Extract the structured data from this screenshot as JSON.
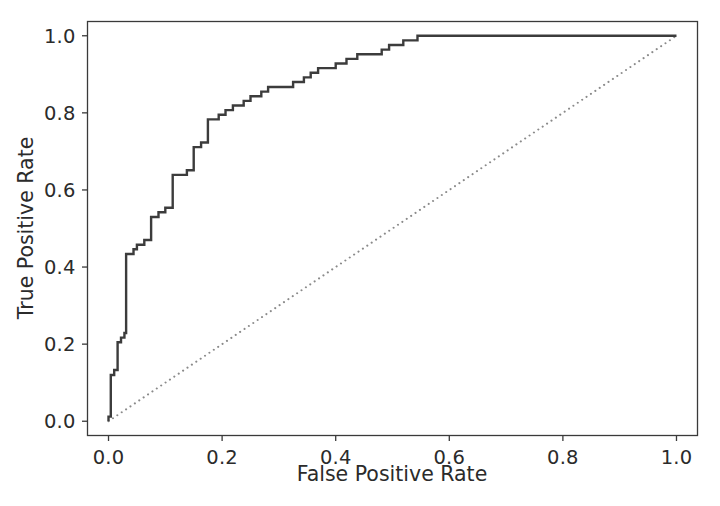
{
  "chart_data": {
    "type": "line",
    "title": "",
    "xlabel": "False Positive Rate",
    "ylabel": "True Positive Rate",
    "xlim": [
      -0.037,
      1.037
    ],
    "ylim": [
      -0.037,
      1.037
    ],
    "grid": false,
    "legend": null,
    "xticks": [
      "0.0",
      "0.2",
      "0.4",
      "0.6",
      "0.8",
      "1.0"
    ],
    "xtick_values": [
      0.0,
      0.2,
      0.4,
      0.6,
      0.8,
      1.0
    ],
    "yticks": [
      "0.0",
      "0.2",
      "0.4",
      "0.6",
      "0.8",
      "1.0"
    ],
    "ytick_values": [
      0.0,
      0.2,
      0.4,
      0.6,
      0.8,
      1.0
    ],
    "series": [
      {
        "name": "ROC curve",
        "style": "step-post",
        "color": "#3c3c3c",
        "linewidth": 2.4,
        "linestyle": "solid",
        "points": [
          [
            0.0,
            0.0
          ],
          [
            0.0,
            0.012
          ],
          [
            0.004,
            0.012
          ],
          [
            0.004,
            0.12
          ],
          [
            0.01,
            0.12
          ],
          [
            0.01,
            0.133
          ],
          [
            0.016,
            0.133
          ],
          [
            0.016,
            0.205
          ],
          [
            0.022,
            0.205
          ],
          [
            0.022,
            0.217
          ],
          [
            0.028,
            0.217
          ],
          [
            0.028,
            0.229
          ],
          [
            0.031,
            0.229
          ],
          [
            0.031,
            0.434
          ],
          [
            0.044,
            0.434
          ],
          [
            0.044,
            0.446
          ],
          [
            0.05,
            0.446
          ],
          [
            0.05,
            0.458
          ],
          [
            0.063,
            0.458
          ],
          [
            0.063,
            0.47
          ],
          [
            0.075,
            0.47
          ],
          [
            0.075,
            0.53
          ],
          [
            0.088,
            0.53
          ],
          [
            0.088,
            0.542
          ],
          [
            0.1,
            0.542
          ],
          [
            0.1,
            0.554
          ],
          [
            0.113,
            0.554
          ],
          [
            0.113,
            0.639
          ],
          [
            0.138,
            0.639
          ],
          [
            0.138,
            0.651
          ],
          [
            0.15,
            0.651
          ],
          [
            0.15,
            0.711
          ],
          [
            0.163,
            0.711
          ],
          [
            0.163,
            0.723
          ],
          [
            0.175,
            0.723
          ],
          [
            0.175,
            0.783
          ],
          [
            0.194,
            0.783
          ],
          [
            0.194,
            0.795
          ],
          [
            0.206,
            0.795
          ],
          [
            0.206,
            0.807
          ],
          [
            0.219,
            0.807
          ],
          [
            0.219,
            0.819
          ],
          [
            0.238,
            0.819
          ],
          [
            0.238,
            0.831
          ],
          [
            0.25,
            0.831
          ],
          [
            0.25,
            0.843
          ],
          [
            0.269,
            0.843
          ],
          [
            0.269,
            0.855
          ],
          [
            0.281,
            0.855
          ],
          [
            0.281,
            0.867
          ],
          [
            0.325,
            0.867
          ],
          [
            0.325,
            0.88
          ],
          [
            0.344,
            0.88
          ],
          [
            0.344,
            0.892
          ],
          [
            0.356,
            0.892
          ],
          [
            0.356,
            0.904
          ],
          [
            0.369,
            0.904
          ],
          [
            0.369,
            0.916
          ],
          [
            0.4,
            0.916
          ],
          [
            0.4,
            0.928
          ],
          [
            0.419,
            0.928
          ],
          [
            0.419,
            0.94
          ],
          [
            0.438,
            0.94
          ],
          [
            0.438,
            0.952
          ],
          [
            0.481,
            0.952
          ],
          [
            0.481,
            0.964
          ],
          [
            0.494,
            0.964
          ],
          [
            0.494,
            0.976
          ],
          [
            0.519,
            0.976
          ],
          [
            0.519,
            0.988
          ],
          [
            0.544,
            0.988
          ],
          [
            0.544,
            1.0
          ],
          [
            1.0,
            1.0
          ]
        ]
      },
      {
        "name": "chance diagonal",
        "style": "line",
        "color": "#8a8a8a",
        "linewidth": 2.0,
        "linestyle": "dotted",
        "points": [
          [
            0.0,
            0.0
          ],
          [
            1.0,
            1.0
          ]
        ]
      }
    ],
    "axes": {
      "spine_color": "#3a3a3a",
      "background": "#ffffff"
    }
  }
}
